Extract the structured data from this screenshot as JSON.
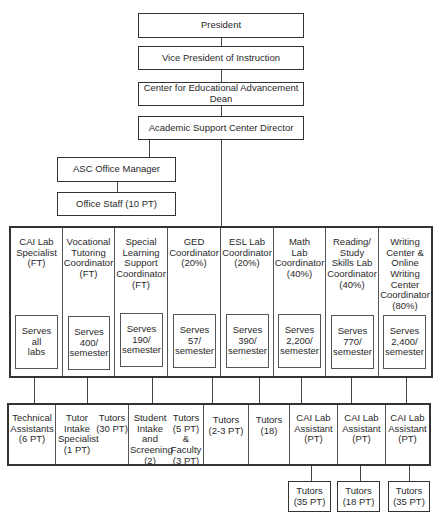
{
  "chain": {
    "president": "President",
    "vp": "Vice President of Instruction",
    "dean": "Center for Educational Advancement Dean",
    "director": "Academic Support Center Director"
  },
  "office": {
    "manager": "ASC Office Manager",
    "staff": "Office Staff (10 PT)"
  },
  "coordinators": [
    {
      "title": "CAI Lab\nSpecialist\n(FT)",
      "serves": "Serves\nall\nlabs"
    },
    {
      "title": "Vocational\nTutoring\nCoordinator\n(FT)",
      "serves": "Serves\n400/\nsemester"
    },
    {
      "title": "Special\nLearning\nSupport\nCoordinator\n(FT)",
      "serves": "Serves\n190/\nsemester"
    },
    {
      "title": "GED\nCoordinator\n(20%)",
      "serves": "Serves\n57/\nsemester"
    },
    {
      "title": "ESL Lab\nCoordinator\n(20%)",
      "serves": "Serves\n390/\nsemester"
    },
    {
      "title": "Math\nLab\nCoordinator\n(40%)",
      "serves": "Serves\n2,200/\nsemester"
    },
    {
      "title": "Reading/\nStudy\nSkills Lab\nCoordinator\n(40%)",
      "serves": "Serves\n770/\nsemester"
    },
    {
      "title": "Writing\nCenter &\nOnline\nWriting\nCenter\nCoordinator\n(80%)",
      "serves": "Serves\n2,400/\nsemester"
    }
  ],
  "staff_row": [
    {
      "label": "Technical\nAssistants\n(6 PT)"
    },
    {
      "label_a": "Tutor\nIntake\nSpecialist\n(1 PT)",
      "label_b": "Tutors\n(30 PT)"
    },
    {
      "label_a": "Student\nIntake\nand\nScreening\n(2)",
      "label_b": "Tutors\n(5 PT)\n&\nFaculty\n(3 PT)"
    },
    {
      "label": "Tutors\n(2-3 PT)"
    },
    {
      "label": "Tutors\n(18)"
    },
    {
      "label": "CAI Lab\nAssistant\n(PT)"
    },
    {
      "label": "CAI Lab\nAssistant\n(PT)"
    },
    {
      "label": "CAI Lab\nAssistant\n(PT)"
    }
  ],
  "tutor_boxes": [
    {
      "label": "Tutors\n(35 PT)"
    },
    {
      "label": "Tutors\n(18 PT)"
    },
    {
      "label": "Tutors\n(35 PT)"
    }
  ]
}
